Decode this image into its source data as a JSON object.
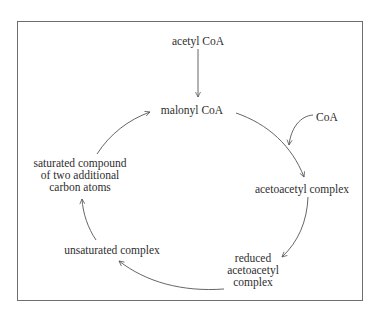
{
  "diagram": {
    "type": "cycle",
    "nodes": {
      "acetyl_coa": {
        "label": "acetyl CoA"
      },
      "malonyl_coa": {
        "label": "malonyl CoA"
      },
      "coa": {
        "label": "CoA"
      },
      "acetoacetyl_complex": {
        "label": "acetoacetyl complex"
      },
      "reduced_acetoacetyl_complex": {
        "lines": [
          "reduced",
          "acetoacetyl",
          "complex"
        ]
      },
      "unsaturated_complex": {
        "label": "unsaturated complex"
      },
      "saturated_compound": {
        "lines": [
          "saturated compound",
          "of two additional",
          "carbon atoms"
        ]
      }
    },
    "edges": [
      {
        "from": "acetyl CoA",
        "to": "malonyl CoA"
      },
      {
        "from": "malonyl CoA",
        "to": "acetoacetyl complex"
      },
      {
        "from": "CoA",
        "to": "malonyl CoA → acetoacetyl complex arc"
      },
      {
        "from": "acetoacetyl complex",
        "to": "reduced acetoacetyl complex"
      },
      {
        "from": "reduced acetoacetyl complex",
        "to": "unsaturated complex"
      },
      {
        "from": "unsaturated complex",
        "to": "saturated compound of two additional carbon atoms"
      },
      {
        "from": "saturated compound of two additional carbon atoms",
        "to": "malonyl CoA"
      }
    ],
    "colors": {
      "text": "#2e2e2e",
      "arrow": "#555555",
      "frame": "#6e6e6e",
      "background": "#ffffff"
    }
  }
}
